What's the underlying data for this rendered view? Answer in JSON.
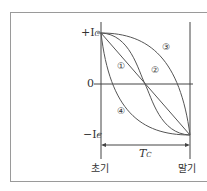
{
  "diagram": {
    "y_labels": {
      "top": "+I",
      "top_sub": "C",
      "zero": "0",
      "bottom": "−I",
      "bottom_sub": "C"
    },
    "x_labels": {
      "start": "초기",
      "end": "말기"
    },
    "period_label": "T",
    "period_sub": "C",
    "curve_labels": [
      "①",
      "②",
      "③",
      "④"
    ],
    "colors": {
      "line": "#555555",
      "axis": "#444444",
      "frame": "#9a9a9a"
    }
  }
}
